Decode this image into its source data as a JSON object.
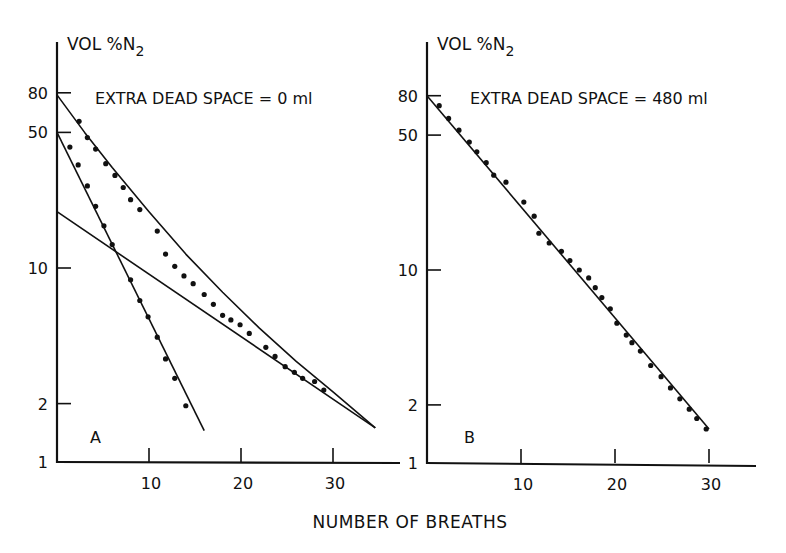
{
  "figure": {
    "xlabel": "NUMBER OF BREATHS"
  },
  "chart_data": [
    {
      "type": "scatter",
      "panel": "A",
      "title": "EXTRA DEAD SPACE = 0 ml",
      "ylabel": "VOL %N2",
      "ylabel_main": "VOL %N",
      "ylabel_sub": "2",
      "xlabel": "NUMBER OF BREATHS",
      "yscale": "log",
      "xlim": [
        0,
        38
      ],
      "ylim": [
        1,
        150
      ],
      "yticks": [
        1,
        2,
        10,
        50,
        80
      ],
      "xticks": [
        10,
        20,
        30
      ],
      "grid": false,
      "series": [
        {
          "name": "fast compartment points",
          "kind": "points",
          "x": [
            1.4,
            2.3,
            3.3,
            4.2,
            5.1,
            6.0,
            8.0,
            9.0,
            9.9,
            10.9,
            11.8,
            12.8,
            14.0
          ],
          "y": [
            42.0,
            34.0,
            26.5,
            20.8,
            16.5,
            13.2,
            8.7,
            6.8,
            5.6,
            4.4,
            3.4,
            2.7,
            1.95
          ]
        },
        {
          "name": "total washout points",
          "kind": "points",
          "x": [
            2.4,
            3.3,
            4.2,
            5.3,
            6.3,
            7.2,
            8.0,
            9.0,
            10.9,
            11.8,
            12.8,
            13.8,
            14.8,
            16.0,
            17.0,
            18.0,
            18.9,
            19.9,
            20.9,
            22.7,
            23.7,
            24.8,
            25.8,
            26.7,
            28.0,
            29.0
          ],
          "y": [
            57.0,
            47.0,
            41.0,
            34.5,
            30.0,
            26.0,
            22.5,
            20.0,
            15.5,
            11.8,
            10.2,
            9.1,
            8.3,
            7.3,
            6.5,
            5.7,
            5.4,
            5.1,
            4.6,
            3.9,
            3.5,
            3.1,
            2.9,
            2.7,
            2.6,
            2.35
          ]
        },
        {
          "name": "fast compartment line",
          "kind": "line",
          "x": [
            0,
            16
          ],
          "y": [
            50,
            1.45
          ]
        },
        {
          "name": "slow compartment line",
          "kind": "line",
          "x": [
            0,
            34.6
          ],
          "y": [
            19.5,
            1.5
          ]
        },
        {
          "name": "sum curve",
          "kind": "curve",
          "x": [
            0,
            3,
            6,
            10,
            14,
            18,
            22,
            26,
            30,
            34.6
          ],
          "y": [
            78,
            50,
            33,
            19.5,
            11.8,
            7.5,
            4.9,
            3.3,
            2.3,
            1.5
          ]
        }
      ],
      "annotations": [
        "A"
      ]
    },
    {
      "type": "scatter",
      "panel": "B",
      "title": "EXTRA DEAD SPACE = 480 ml",
      "ylabel": "VOL %N2",
      "ylabel_main": "VOL %N",
      "ylabel_sub": "2",
      "xlabel": "NUMBER OF BREATHS",
      "yscale": "log",
      "xlim": [
        0,
        35
      ],
      "ylim": [
        1,
        150
      ],
      "yticks": [
        1,
        2,
        10,
        50,
        80
      ],
      "xticks": [
        10,
        20,
        30
      ],
      "grid": false,
      "series": [
        {
          "name": "washout points",
          "kind": "points",
          "x": [
            1.3,
            2.3,
            3.4,
            4.5,
            5.3,
            6.3,
            7.1,
            8.4,
            10.3,
            11.4,
            11.9,
            13.0,
            14.3,
            15.2,
            16.2,
            17.2,
            17.9,
            18.6,
            19.5,
            20.2,
            21.2,
            21.8,
            22.7,
            23.8,
            24.9,
            25.9,
            26.9,
            27.9,
            28.7,
            29.7
          ],
          "y": [
            71.0,
            61.0,
            53.0,
            46.0,
            41.0,
            36.0,
            31.0,
            28.5,
            22.5,
            19.0,
            15.5,
            13.8,
            12.5,
            11.2,
            10.0,
            9.1,
            8.1,
            7.2,
            6.3,
            5.3,
            4.6,
            4.2,
            3.8,
            3.2,
            2.8,
            2.45,
            2.15,
            1.9,
            1.7,
            1.5
          ]
        },
        {
          "name": "exponential fit line",
          "kind": "line",
          "x": [
            0,
            30
          ],
          "y": [
            80,
            1.5
          ]
        }
      ],
      "annotations": [
        "B"
      ]
    }
  ],
  "layout": {
    "panels": [
      {
        "x0": 57,
        "y0": 462,
        "pxPerX": 9.2,
        "pxPerDecade": 194,
        "yTop": 42,
        "xEnd": 400,
        "tickLabelX": 38,
        "titleX": 95,
        "titleY": 104,
        "ylabX": 67,
        "ylabY": 50,
        "letterX": 90,
        "letterY": 443
      },
      {
        "x0": 427,
        "y0": 463,
        "pxPerX": 9.4,
        "pxPerDecade": 193,
        "yTop": 42,
        "xEnd": 756,
        "tickLabelX": 408,
        "titleX": 470,
        "titleY": 104,
        "ylabX": 437,
        "ylabY": 50,
        "letterX": 464,
        "letterY": 443
      }
    ]
  }
}
